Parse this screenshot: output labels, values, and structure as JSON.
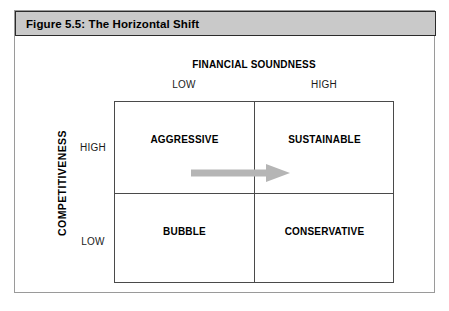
{
  "figure": {
    "title": "Figure 5.5:  The Horizontal Shift"
  },
  "axes": {
    "column_axis_title": "FINANCIAL SOUNDNESS",
    "column_ticks": [
      "LOW",
      "HIGH"
    ],
    "row_axis_title": "COMPETITIVENESS",
    "row_ticks": [
      "HIGH",
      "LOW"
    ]
  },
  "matrix": {
    "cells": [
      {
        "position": "top-left",
        "label": "AGGRESSIVE"
      },
      {
        "position": "top-right",
        "label": "SUSTAINABLE"
      },
      {
        "position": "bottom-left",
        "label": "BUBBLE"
      },
      {
        "position": "bottom-right",
        "label": "CONSERVATIVE"
      }
    ]
  },
  "annotation": {
    "arrow": {
      "name": "horizontal-shift-arrow",
      "direction": "right",
      "from_cell": "AGGRESSIVE",
      "to_cell": "SUSTAINABLE",
      "color": "#b5b5b5"
    }
  },
  "colors": {
    "titlebar_background": "#c9c9c9",
    "titlebar_border": "#2b2b2b",
    "frame_border": "#9a9a9a",
    "matrix_border": "#4a4a4a",
    "text": "#000000",
    "page_background": "#ffffff"
  }
}
